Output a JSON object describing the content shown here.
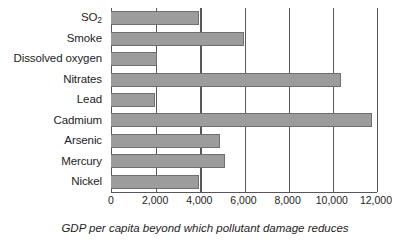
{
  "chart_data": {
    "type": "bar",
    "orientation": "horizontal",
    "title": "",
    "xlabel": "GDP per capita beyond which pollutant damage reduces",
    "ylabel": "",
    "categories": [
      "SO2",
      "Smoke",
      "Dissolved oxygen",
      "Nitrates",
      "Lead",
      "Cadmium",
      "Arsenic",
      "Mercury",
      "Nickel"
    ],
    "category_labels_html": [
      "SO<sub>2</sub>",
      "Smoke",
      "Dissolved oxygen",
      "Nitrates",
      "Lead",
      "Cadmium",
      "Arsenic",
      "Mercury",
      "Nickel"
    ],
    "values": [
      4000,
      6000,
      2100,
      10400,
      2000,
      11800,
      4950,
      5150,
      4000
    ],
    "xlim": [
      0,
      12000
    ],
    "xticks": [
      0,
      2000,
      4000,
      6000,
      8000,
      10000,
      12000
    ],
    "xtick_labels": [
      "0",
      "2,000",
      "4,000",
      "6,000",
      "8,000",
      "10,000",
      "12,000"
    ],
    "grid": "vertical",
    "legend": "none",
    "bar_color": "#9b9c9b",
    "bar_border_color": "#6e6f70",
    "axis_color": "#56575a",
    "text_color": "#1d1d1d"
  }
}
